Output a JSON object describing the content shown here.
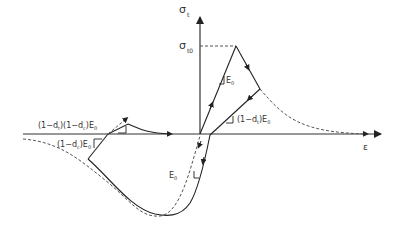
{
  "figure": {
    "type": "concrete damaged plasticity uniaxial cyclic stress-strain diagram",
    "axes": {
      "x_label": "ε",
      "y_label": "σ",
      "y_label_sub": "t"
    },
    "labels": {
      "peak_stress": "σ",
      "peak_stress_sub": "t0",
      "tension_slope": "E",
      "tension_slope_sub": "0",
      "tension_unload_prefix": "(1−d",
      "tension_unload_sub_d": "t",
      "tension_unload_suffix": ")E",
      "tension_unload_sub_e": "0",
      "compression_unload_prefix": "(1−d",
      "compression_unload_sub_d": "c",
      "compression_unload_suffix": ")E",
      "compression_unload_sub_e": "0",
      "reload_part1": "(1−d",
      "reload_sub1": "t",
      "reload_part2": ")(1−d",
      "reload_sub2": "c",
      "reload_part3": ")E",
      "reload_sub3": "0",
      "compression_slope": "E",
      "compression_slope_sub": "0"
    },
    "colors": {
      "line": "#222222",
      "dashed": "#555555"
    }
  }
}
